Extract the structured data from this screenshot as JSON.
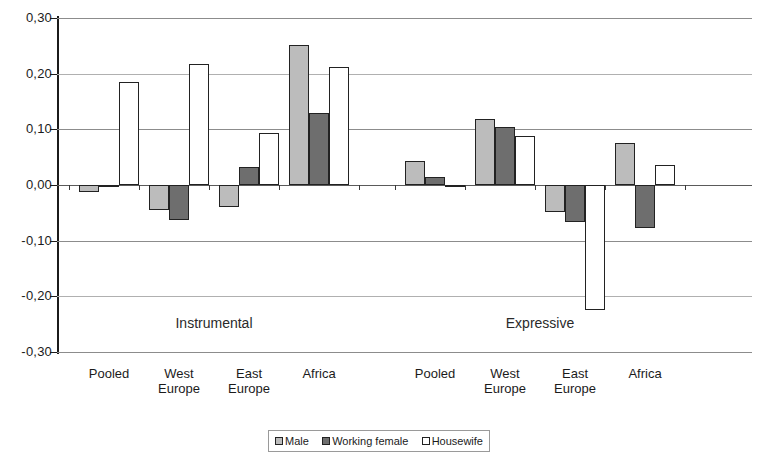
{
  "chart_data": {
    "type": "bar",
    "title": "",
    "xlabel": "",
    "ylabel": "",
    "ylim": [
      -0.3,
      0.3
    ],
    "grid": true,
    "legend_position": "bottom",
    "y_tick_labels": [
      "0,30",
      "0,20",
      "0,10",
      "0,00",
      "-0,10",
      "-0,20",
      "-0,30"
    ],
    "y_tick_values": [
      0.3,
      0.2,
      0.1,
      0.0,
      -0.1,
      -0.2,
      -0.3
    ],
    "panels": [
      {
        "label": "Instrumental"
      },
      {
        "label": "Expressive"
      }
    ],
    "categories": [
      "Pooled",
      "West\nEurope",
      "East\nEurope",
      "Africa"
    ],
    "series_names": [
      "Male",
      "Working female",
      "Housewife"
    ],
    "series_colors": [
      "#bcbcbc",
      "#6e6e6e",
      "#ffffff"
    ],
    "groups": [
      {
        "panel": "Instrumental",
        "category": "Pooled",
        "values": {
          "male": -0.012,
          "working_female": -0.004,
          "housewife": 0.185
        }
      },
      {
        "panel": "Instrumental",
        "category": "West Europe",
        "values": {
          "male": -0.045,
          "working_female": -0.062,
          "housewife": 0.218
        }
      },
      {
        "panel": "Instrumental",
        "category": "East Europe",
        "values": {
          "male": -0.04,
          "working_female": 0.032,
          "housewife": 0.094
        }
      },
      {
        "panel": "Instrumental",
        "category": "Africa",
        "values": {
          "male": 0.252,
          "working_female": 0.13,
          "housewife": 0.212
        }
      },
      {
        "panel": "Expressive",
        "category": "Pooled",
        "values": {
          "male": 0.044,
          "working_female": 0.014,
          "housewife": -0.002
        }
      },
      {
        "panel": "Expressive",
        "category": "West Europe",
        "values": {
          "male": 0.118,
          "working_female": 0.104,
          "housewife": 0.088
        }
      },
      {
        "panel": "Expressive",
        "category": "East Europe",
        "values": {
          "male": -0.048,
          "working_female": -0.066,
          "housewife": -0.225
        }
      },
      {
        "panel": "Expressive",
        "category": "Africa",
        "values": {
          "male": 0.075,
          "working_female": -0.078,
          "housewife": 0.036
        }
      }
    ],
    "legend": [
      {
        "label": "Male",
        "swatch": "male"
      },
      {
        "label": "Working female",
        "swatch": "wfemale"
      },
      {
        "label": "Housewife",
        "swatch": "housewife"
      }
    ]
  }
}
